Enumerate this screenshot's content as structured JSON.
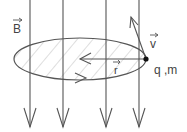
{
  "diagram": {
    "field_label": "B",
    "velocity_label": "v",
    "radius_label": "r",
    "charge_label": "q ,m",
    "colors": {
      "stroke": "#555555",
      "hatch": "#bbbbbb",
      "point": "#111111"
    },
    "field_lines_x": [
      30,
      63,
      106,
      139
    ]
  }
}
